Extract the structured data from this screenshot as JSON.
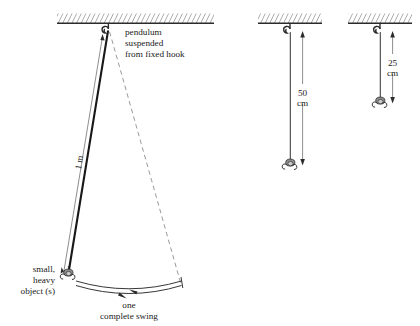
{
  "diagram": {
    "background_color": "#ffffff",
    "ink_color": "#1a1a1a"
  },
  "main_pendulum": {
    "annotation_lines": [
      "pendulum",
      "suspended",
      "from fixed hook"
    ],
    "length_label": "1 m",
    "bob_label_lines": [
      "small,",
      "heavy",
      "object (s)"
    ],
    "swing_label_lines": [
      "one",
      "complete  swing"
    ],
    "hook_icon": "ceiling-hook-icon",
    "bob_icon": "pendulum-bob-icon"
  },
  "pendulum_50": {
    "length_value": "50",
    "length_unit": "cm",
    "hook_icon": "ceiling-hook-icon",
    "bob_icon": "pendulum-bob-icon"
  },
  "pendulum_25": {
    "length_value": "25",
    "length_unit": "cm",
    "hook_icon": "ceiling-hook-icon",
    "bob_icon": "pendulum-bob-icon"
  }
}
